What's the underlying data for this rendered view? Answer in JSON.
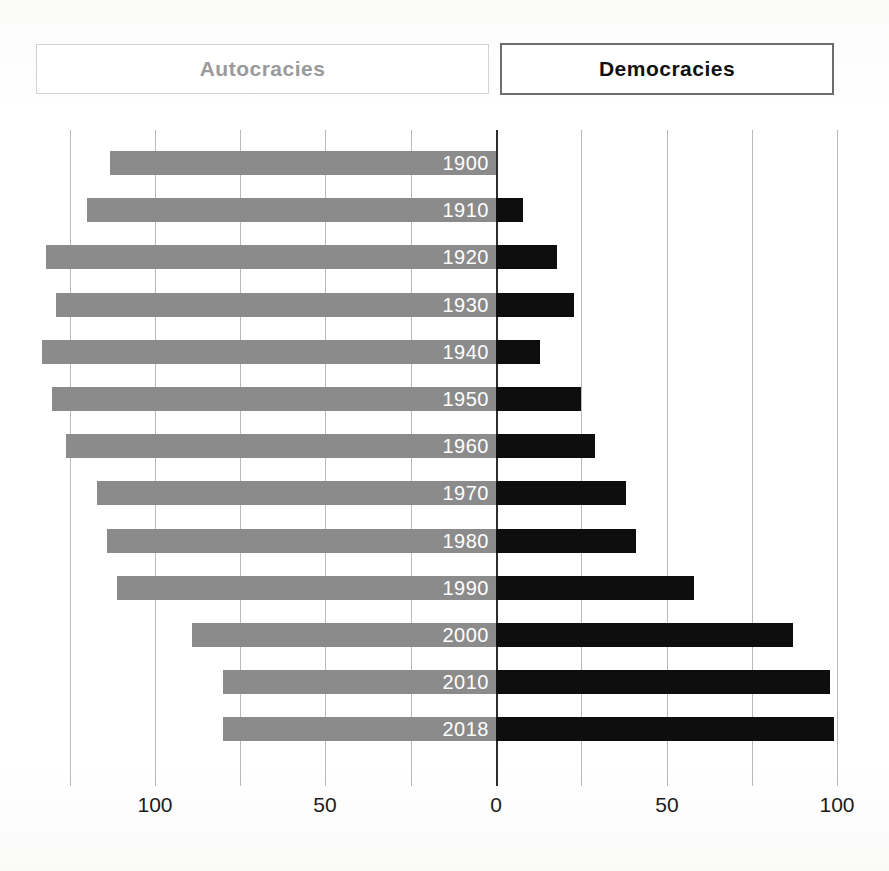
{
  "legend": {
    "left": {
      "label": "Autocracies",
      "color": "#8b8b8b"
    },
    "right": {
      "label": "Democracies",
      "color": "#0e0e0e"
    }
  },
  "axis": {
    "tick_labels": [
      "100",
      "50",
      "0",
      "50",
      "100"
    ],
    "gridline_values": [
      125,
      100,
      75,
      50,
      25,
      0,
      25,
      50,
      75,
      100
    ]
  },
  "chart_data": {
    "type": "bar",
    "title": "",
    "subtitle": "",
    "orientation": "horizontal",
    "style": "diverging-population-pyramid",
    "xlabel": "",
    "ylabel": "",
    "categories": [
      "1900",
      "1910",
      "1920",
      "1930",
      "1940",
      "1950",
      "1960",
      "1970",
      "1980",
      "1990",
      "2000",
      "2010",
      "2018"
    ],
    "series": [
      {
        "name": "Autocracies",
        "direction": "left",
        "color": "#8b8b8b",
        "values": [
          113,
          120,
          132,
          129,
          133,
          130,
          126,
          117,
          114,
          111,
          89,
          80,
          80
        ]
      },
      {
        "name": "Democracies",
        "direction": "right",
        "color": "#0e0e0e",
        "values": [
          0,
          8,
          18,
          23,
          13,
          25,
          29,
          38,
          41,
          58,
          87,
          98,
          99
        ]
      }
    ],
    "xlim_left": [
      0,
      140
    ],
    "xlim_right": [
      0,
      100
    ],
    "grid": true,
    "grid_step": 25,
    "legend_position": "top"
  },
  "bars": [
    {
      "year": "1900",
      "left": 113,
      "right": 0
    },
    {
      "year": "1910",
      "left": 120,
      "right": 8
    },
    {
      "year": "1920",
      "left": 132,
      "right": 18
    },
    {
      "year": "1930",
      "left": 129,
      "right": 23
    },
    {
      "year": "1940",
      "left": 133,
      "right": 13
    },
    {
      "year": "1950",
      "left": 130,
      "right": 25
    },
    {
      "year": "1960",
      "left": 126,
      "right": 29
    },
    {
      "year": "1970",
      "left": 117,
      "right": 38
    },
    {
      "year": "1980",
      "left": 114,
      "right": 41
    },
    {
      "year": "1990",
      "left": 111,
      "right": 58
    },
    {
      "year": "2000",
      "left": 89,
      "right": 87
    },
    {
      "year": "2010",
      "left": 80,
      "right": 98
    },
    {
      "year": "2018",
      "left": 80,
      "right": 99
    }
  ]
}
